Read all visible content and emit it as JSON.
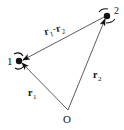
{
  "diagram": {
    "particles": [
      {
        "id": "1",
        "label": "1"
      },
      {
        "id": "2",
        "label": "2"
      }
    ],
    "origin": {
      "label": "O"
    },
    "vectors": [
      {
        "id": "r1",
        "label_main": "r",
        "label_sub": "1",
        "from": "O",
        "to": "1"
      },
      {
        "id": "r2",
        "label_main": "r",
        "label_sub": "2",
        "from": "O",
        "to": "2"
      },
      {
        "id": "r1-r2",
        "label_a": "r",
        "label_a_sub": "1",
        "label_op": "-",
        "label_b": "r",
        "label_b_sub": "2",
        "from": "2",
        "to": "1"
      }
    ],
    "colors": {
      "ink": "#111111",
      "background": "#ffffff"
    }
  }
}
